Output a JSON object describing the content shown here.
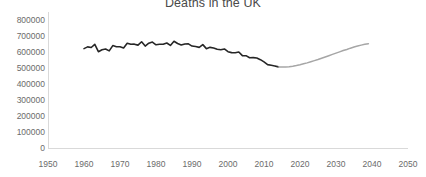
{
  "chart_data": {
    "type": "line",
    "title": "Deaths in the UK",
    "xlabel": "",
    "ylabel": "",
    "xlim": [
      1950,
      2050
    ],
    "ylim": [
      0,
      800000
    ],
    "grid": false,
    "legend": false,
    "x_ticks": [
      1950,
      1960,
      1970,
      1980,
      1990,
      2000,
      2010,
      2020,
      2030,
      2040,
      2050
    ],
    "y_ticks": [
      0,
      100000,
      200000,
      300000,
      400000,
      500000,
      600000,
      700000,
      800000
    ],
    "x_tick_labels": [
      "1950",
      "1960",
      "1970",
      "1980",
      "1990",
      "2000",
      "2010",
      "2020",
      "2030",
      "2040",
      "2050"
    ],
    "y_tick_labels": [
      "0",
      "100000",
      "200000",
      "300000",
      "400000",
      "500000",
      "600000",
      "700000",
      "800000"
    ],
    "colors": {
      "historical": "#262626",
      "projection": "#a6a6a6",
      "axis": "#d9d9d9",
      "text": "#6b6b6b",
      "title": "#4a4a4a",
      "background": "#ffffff"
    },
    "series": [
      {
        "name": "historical",
        "style": "solid-dark",
        "x": [
          1960,
          1961,
          1962,
          1963,
          1964,
          1965,
          1966,
          1967,
          1968,
          1969,
          1970,
          1971,
          1972,
          1973,
          1974,
          1975,
          1976,
          1977,
          1978,
          1979,
          1980,
          1981,
          1982,
          1983,
          1984,
          1985,
          1986,
          1987,
          1988,
          1989,
          1990,
          1991,
          1992,
          1993,
          1994,
          1995,
          1996,
          1997,
          1998,
          1999,
          2000,
          2001,
          2002,
          2003,
          2004,
          2005,
          2006,
          2007,
          2008,
          2009,
          2010,
          2011,
          2012,
          2013,
          2014
        ],
        "values": [
          621000,
          632000,
          628000,
          648000,
          602000,
          614000,
          619000,
          607000,
          640000,
          633000,
          633000,
          625000,
          655000,
          648000,
          649000,
          643000,
          664000,
          637000,
          655000,
          662000,
          645000,
          648000,
          648000,
          656000,
          641000,
          667000,
          653000,
          644000,
          650000,
          651000,
          637000,
          634000,
          629000,
          646000,
          621000,
          629000,
          625000,
          617000,
          614000,
          619000,
          602000,
          596000,
          595000,
          600000,
          577000,
          577000,
          564000,
          565000,
          562000,
          552000,
          538000,
          521000,
          517000,
          513000,
          507000
        ]
      },
      {
        "name": "projection",
        "style": "solid-light",
        "x": [
          2014,
          2015,
          2016,
          2017,
          2018,
          2019,
          2020,
          2021,
          2022,
          2023,
          2024,
          2025,
          2026,
          2027,
          2028,
          2029,
          2030,
          2031,
          2032,
          2033,
          2034,
          2035,
          2036,
          2037,
          2038,
          2039
        ],
        "values": [
          507000,
          506000,
          506000,
          508000,
          511000,
          515000,
          520000,
          526000,
          532000,
          539000,
          546000,
          553000,
          561000,
          569000,
          577000,
          585000,
          593000,
          601000,
          609000,
          616000,
          624000,
          631000,
          637000,
          643000,
          648000,
          652000
        ]
      }
    ]
  }
}
